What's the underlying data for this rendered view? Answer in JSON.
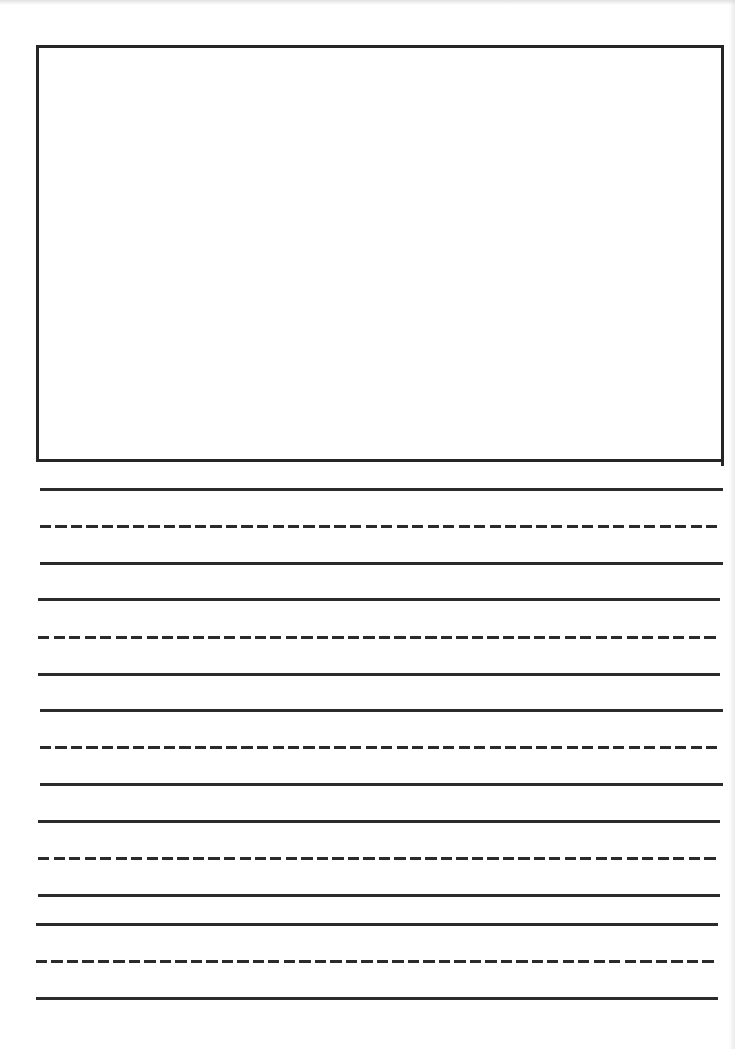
{
  "document": {
    "type": "primary writing paper",
    "title": "",
    "background_color": "#ffffff",
    "ink_color": "#2b2b2b"
  },
  "drawing_box": {
    "label": "drawing area",
    "left": 36,
    "top": 45,
    "width": 688,
    "height": 417,
    "border_width": 3,
    "border_color": "#262626"
  },
  "writing_area": {
    "label": "handwriting lines",
    "line_thickness": 3,
    "dash_length": 11,
    "dash_gap": 4.5,
    "line_sets": [
      {
        "index": 1,
        "top_line": {
          "y": 488,
          "left": 40,
          "right": 723,
          "style": "solid"
        },
        "mid_line": {
          "y": 525,
          "left": 40,
          "right": 720,
          "style": "dashed"
        },
        "base_line": {
          "y": 562,
          "left": 40,
          "right": 723,
          "style": "solid"
        }
      },
      {
        "index": 2,
        "top_line": {
          "y": 598,
          "left": 38,
          "right": 720,
          "style": "solid"
        },
        "mid_line": {
          "y": 636,
          "left": 38,
          "right": 717,
          "style": "dashed"
        },
        "base_line": {
          "y": 673,
          "left": 38,
          "right": 720,
          "style": "solid"
        }
      },
      {
        "index": 3,
        "top_line": {
          "y": 709,
          "left": 40,
          "right": 723,
          "style": "solid"
        },
        "mid_line": {
          "y": 746,
          "left": 40,
          "right": 720,
          "style": "dashed"
        },
        "base_line": {
          "y": 783,
          "left": 40,
          "right": 723,
          "style": "solid"
        }
      },
      {
        "index": 4,
        "top_line": {
          "y": 820,
          "left": 38,
          "right": 720,
          "style": "solid"
        },
        "mid_line": {
          "y": 857,
          "left": 38,
          "right": 717,
          "style": "dashed"
        },
        "base_line": {
          "y": 894,
          "left": 38,
          "right": 720,
          "style": "solid"
        }
      },
      {
        "index": 5,
        "top_line": {
          "y": 923,
          "left": 36,
          "right": 718,
          "style": "solid"
        },
        "mid_line": {
          "y": 960,
          "left": 36,
          "right": 716,
          "style": "dashed"
        },
        "base_line": {
          "y": 997,
          "left": 36,
          "right": 718,
          "style": "solid"
        }
      }
    ]
  }
}
